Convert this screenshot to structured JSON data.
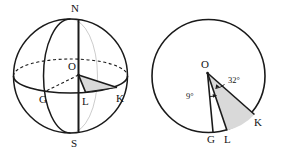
{
  "figure": {
    "stroke_color": "#1a1a1a",
    "shade_color": "#d9d9d9",
    "background_color": "#ffffff",
    "left_diagram": {
      "name": "sphere-diagram",
      "labels": {
        "north_pole": "N",
        "south_pole": "S",
        "center": "O",
        "point_g": "G",
        "point_l": "L",
        "point_k": "K"
      }
    },
    "right_diagram": {
      "name": "circle-diagram",
      "labels": {
        "center": "O",
        "point_g": "G",
        "point_l": "L",
        "point_k": "K"
      },
      "angles": {
        "angle_gol": "9°",
        "angle_lok": "32°"
      }
    }
  }
}
